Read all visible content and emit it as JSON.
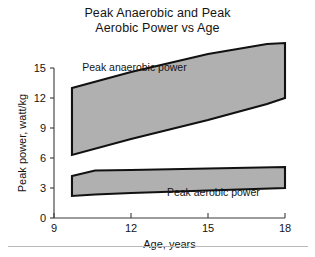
{
  "figure": {
    "title_lines": [
      "Peak Anaerobic and Peak",
      "Aerobic Power vs Age"
    ],
    "background": "#ffffff"
  },
  "chart_data": {
    "type": "area",
    "title": "Peak Anaerobic and Peak Aerobic Power vs Age",
    "xlabel": "Age, years",
    "ylabel": "Peak power, watt/kg",
    "xlim": [
      9,
      18
    ],
    "ylim": [
      0,
      15
    ],
    "xticks": [
      9,
      12,
      15,
      18
    ],
    "yticks": [
      0,
      3,
      6,
      9,
      12,
      15
    ],
    "xtick_labels": [
      "9",
      "12",
      "15",
      "18"
    ],
    "ytick_labels": [
      "0",
      "3",
      "6",
      "9",
      "12",
      "15"
    ],
    "grid": false,
    "legend_position": "inline-annotation",
    "band_fill": "#b0b0b0",
    "band_edge": "#111111",
    "series": [
      {
        "name": "Peak anaerobic power",
        "annotation": "Peak anaerobic power",
        "x": [
          9.7,
          12.0,
          15.0,
          17.3,
          18.0
        ],
        "upper": [
          13.0,
          14.6,
          16.4,
          17.4,
          17.5
        ],
        "lower": [
          6.3,
          7.9,
          9.8,
          11.4,
          12.0
        ]
      },
      {
        "name": "Peak aerobic power",
        "annotation": "Peak aerobic power",
        "x": [
          9.7,
          10.6,
          12.0,
          15.0,
          18.0
        ],
        "upper": [
          4.2,
          4.75,
          4.8,
          4.95,
          5.1
        ],
        "lower": [
          2.2,
          2.35,
          2.5,
          2.75,
          3.0
        ]
      }
    ],
    "annotations": [
      {
        "text": "Peak anaerobic power",
        "x": 10.1,
        "y": 14.7
      },
      {
        "text": "Peak aerobic power",
        "x": 13.4,
        "y": 2.2
      }
    ]
  }
}
